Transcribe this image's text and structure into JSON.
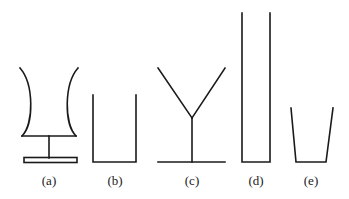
{
  "figure": {
    "labels": [
      "(a)",
      "(b)",
      "(c)",
      "(d)",
      "(e)"
    ],
    "colors": {
      "stroke": "#1a1a1a",
      "background": "#ffffff"
    },
    "shapes": [
      {
        "id": "a",
        "kind": "flared-curved-vessel-on-stand"
      },
      {
        "id": "b",
        "kind": "rectangular-open-container"
      },
      {
        "id": "c",
        "kind": "v-shaped-funnel-on-stem"
      },
      {
        "id": "d",
        "kind": "tall-narrow-tube"
      },
      {
        "id": "e",
        "kind": "tapered-cup"
      }
    ]
  }
}
